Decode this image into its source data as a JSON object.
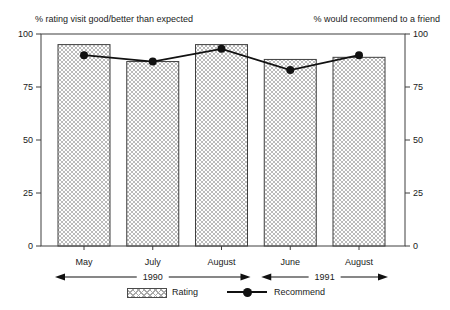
{
  "chart_data": {
    "type": "bar",
    "note_type": "bar series with overlaid line series",
    "categories": [
      "May",
      "July",
      "August",
      "June",
      "August"
    ],
    "category_groups": [
      {
        "label": "1990",
        "from": 0,
        "to": 2
      },
      {
        "label": "1991",
        "from": 3,
        "to": 4
      }
    ],
    "series": [
      {
        "name": "Rating",
        "type": "bar",
        "values": [
          95,
          87,
          95,
          88,
          89
        ]
      },
      {
        "name": "Recommend",
        "type": "line",
        "values": [
          90,
          87,
          93,
          83,
          90
        ]
      }
    ],
    "left_axis_label": "% rating visit good/better than expected",
    "right_axis_label": "% would recommend to a friend",
    "ylim": [
      0,
      100
    ],
    "yticks": [
      0,
      25,
      50,
      75,
      100
    ],
    "grid": false,
    "legend_position": "bottom",
    "legend": [
      {
        "label": "Rating",
        "swatch": "hatched-bar"
      },
      {
        "label": "Recommend",
        "swatch": "line-with-dot"
      }
    ],
    "colors": {
      "bar_hatch": "#aaaaaa",
      "bar_border": "#3f3f3f",
      "line": "#111111",
      "axis": "#3f3f3f",
      "text": "#1a1a1a",
      "background": "#ffffff"
    }
  }
}
